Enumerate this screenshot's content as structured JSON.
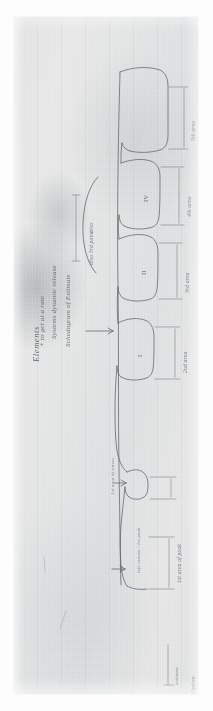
{
  "document": {
    "medium": "photograph-of-handwritten-note",
    "orientation": "page rotated 90 degrees (text reads bottom-to-top)",
    "ink_color": "#5a5f68",
    "paper_color": "#e4e5e5"
  },
  "notes": {
    "heading": "Elements",
    "heading_continuation": "+  to get at a rate",
    "subheading": "Systems dynamic release",
    "left_label": "Schedogram of Estimate",
    "brace_note_top": "also 3rd point",
    "brace_note_bottom": "also"
  },
  "annotations": {
    "left_convex": "left convex / 1st peak",
    "first_area_marker": "1st area of peak",
    "second_area_marker": "1st area\nof waves"
  },
  "waveform": {
    "peak_labels": [
      "I",
      "II",
      "IV"
    ],
    "area_labels": [
      "1st area of peak",
      "2nd area",
      "3rd area",
      "4th area",
      "5th area"
    ]
  },
  "footer": {
    "signature": "Option",
    "caption": "estimate"
  }
}
